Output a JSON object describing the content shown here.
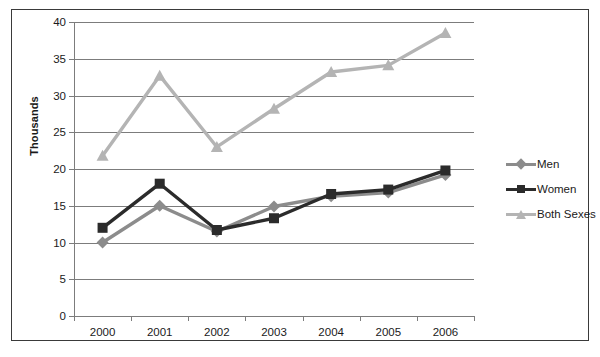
{
  "chart_data": {
    "type": "line",
    "title": "",
    "xlabel": "",
    "ylabel": "Thousands",
    "categories": [
      "2000",
      "2001",
      "2002",
      "2003",
      "2004",
      "2005",
      "2006"
    ],
    "ylim": [
      0,
      40
    ],
    "ytick_step": 5,
    "yticks": [
      "0",
      "5",
      "10",
      "15",
      "20",
      "25",
      "30",
      "35",
      "40"
    ],
    "grid": true,
    "legend_position": "right",
    "series": [
      {
        "name": "Men",
        "color": "#8c8c8c",
        "marker": "diamond",
        "values": [
          10.0,
          15.0,
          11.5,
          14.9,
          16.3,
          16.8,
          19.2
        ]
      },
      {
        "name": "Women",
        "color": "#2b2b2b",
        "marker": "square",
        "values": [
          12.0,
          18.0,
          11.7,
          13.3,
          16.6,
          17.2,
          19.8
        ]
      },
      {
        "name": "Both Sexes",
        "color": "#b4b4b4",
        "marker": "triangle",
        "values": [
          21.8,
          32.7,
          23.0,
          28.2,
          33.2,
          34.1,
          38.5
        ]
      }
    ]
  },
  "colors": {
    "border": "#3a3a3a",
    "gridline": "#7c7c7c",
    "axis_text": "#1a1a1a",
    "background": "#ffffff"
  }
}
